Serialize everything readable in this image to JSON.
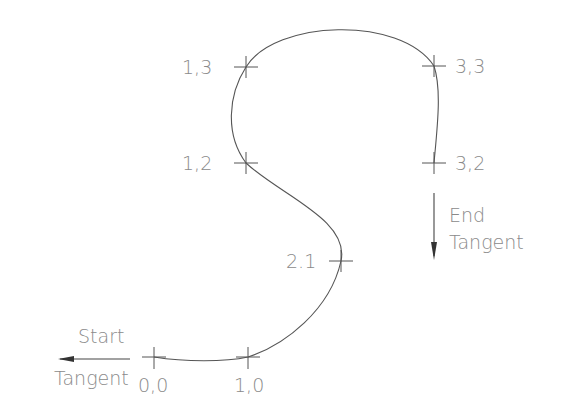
{
  "diagram": {
    "points": [
      {
        "label": "0,0",
        "x": 154,
        "y": 357
      },
      {
        "label": "1,0",
        "x": 248,
        "y": 357
      },
      {
        "label": "2.1",
        "x": 341,
        "y": 261
      },
      {
        "label": "1,2",
        "x": 246,
        "y": 163
      },
      {
        "label": "1,3",
        "x": 246,
        "y": 67
      },
      {
        "label": "3,3",
        "x": 434,
        "y": 66
      },
      {
        "label": "3,2",
        "x": 434,
        "y": 163
      }
    ],
    "start_tangent": {
      "line1": "Start",
      "line2": "Tangent",
      "direction": "left"
    },
    "end_tangent": {
      "line1": "End",
      "line2": "Tangent",
      "direction": "down"
    },
    "colors": {
      "line": "#555555",
      "text": "#8a8a8a"
    }
  }
}
